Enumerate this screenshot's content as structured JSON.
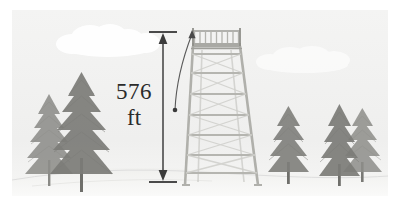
{
  "diagram": {
    "background_color": "#f2f2f1",
    "scene_bounds": {
      "x": 12,
      "y": 10,
      "width": 376,
      "height": 186
    }
  },
  "measurement": {
    "value": "576",
    "unit": "ft",
    "full_label": "576 ft",
    "line_color": "#555555",
    "arrow_x": 163,
    "arrow_top_y": 32,
    "arrow_bottom_y": 182,
    "tick_half_width": 14
  },
  "leader": {
    "name": "curved-pointer",
    "dot_x": 175,
    "dot_y": 110,
    "tip_x": 194,
    "tip_y": 31,
    "color": "#5a5a5a"
  },
  "tower": {
    "name": "fire-lookout-tower",
    "color": "#b9b9b4",
    "deck_y": 48,
    "railing_top_y": 31,
    "top_left_x": 193,
    "top_right_x": 240,
    "base_left_x": 185,
    "base_right_x": 258,
    "base_y": 185,
    "railing_baluster_count": 9,
    "rung_count": 7
  },
  "sky": {
    "clouds": [
      {
        "name": "cloud-left",
        "cx": 100,
        "cy": 40,
        "opacity": 0.95
      },
      {
        "name": "cloud-right",
        "cx": 300,
        "cy": 58,
        "opacity": 0.6
      }
    ]
  },
  "ground": {
    "name": "ground-contour",
    "color": "#dcdcd8",
    "horizon_y": 172
  },
  "trees": [
    {
      "name": "tree-left-rear",
      "x": 38,
      "base_y": 176,
      "height": 92,
      "width": 46,
      "color": "#8e8e8a"
    },
    {
      "name": "tree-left-front",
      "x": 70,
      "base_y": 182,
      "height": 112,
      "width": 56,
      "color": "#7c7c78"
    },
    {
      "name": "tree-right-solo",
      "x": 288,
      "base_y": 184,
      "height": 78,
      "width": 44,
      "color": "#7f7f7b"
    },
    {
      "name": "tree-right-rear",
      "x": 362,
      "base_y": 180,
      "height": 76,
      "width": 42,
      "color": "#8e8e8a"
    },
    {
      "name": "tree-right-front",
      "x": 340,
      "base_y": 186,
      "height": 82,
      "width": 46,
      "color": "#7c7c78"
    }
  ]
}
